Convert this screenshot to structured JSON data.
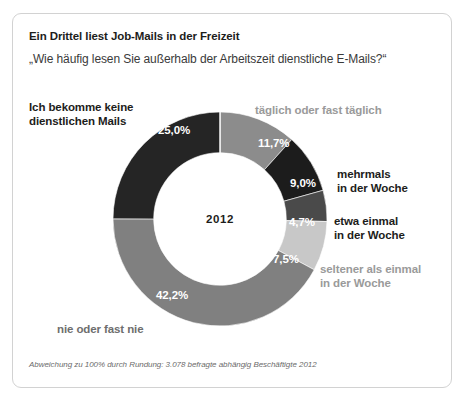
{
  "card": {
    "title": "Ein Drittel liest Job-Mails in der Freizeit",
    "subtitle": "„Wie häufig lesen Sie außerhalb der Arbeitszeit dienstliche E-Mails?“",
    "footnote": "Abweichung zu 100% durch Rundung: 3.078 befragte abhängig Beschäftigte 2012",
    "center_label": "2012"
  },
  "labels": {
    "no_mails": "Ich bekomme keine\ndienstlichen Mails",
    "daily": "täglich oder fast täglich",
    "several_week": "mehrmals\nin der Woche",
    "once_week": "etwa einmal\nin der Woche",
    "less_once_week": "seltener als einmal\nin der Woche",
    "never": "nie oder fast nie"
  },
  "values": {
    "no_mails": "25,0%",
    "daily": "11,7%",
    "several_week": "9,0%",
    "once_week": "4,7%",
    "less_once_week": "7,5%",
    "never": "42,2%"
  },
  "chart_data": {
    "type": "pie",
    "variant": "donut",
    "title": "Ein Drittel liest Job-Mails in der Freizeit",
    "subtitle": "„Wie häufig lesen Sie außerhalb der Arbeitszeit dienstliche E-Mails?“",
    "center_label": "2012",
    "unit": "percent",
    "start_angle_deg": 0,
    "direction": "clockwise",
    "inner_radius_ratio": 0.62,
    "categories": [
      "täglich oder fast täglich",
      "mehrmals in der Woche",
      "etwa einmal in der Woche",
      "seltener als einmal in der Woche",
      "nie oder fast nie",
      "Ich bekomme keine dienstlichen Mails"
    ],
    "values": [
      11.7,
      9.0,
      4.7,
      7.5,
      42.2,
      25.0
    ],
    "value_labels": [
      "11,7%",
      "9,0%",
      "4,7%",
      "7,5%",
      "42,2%",
      "25,0%"
    ],
    "colors": [
      "#8c8c8c",
      "#1c1c1c",
      "#4a4a4a",
      "#c8c8c8",
      "#808080",
      "#252525"
    ],
    "legend": "none",
    "grid": false,
    "note": "Abweichung zu 100% durch Rundung: 3.078 befragte abhängig Beschäftigte 2012",
    "sample_size": 3078,
    "year": 2012
  },
  "theme": {
    "frame_border": "#d2d2d2",
    "text_dark": "#1d1d1b",
    "text_mid": "#6e6e6e",
    "text_muted": "#9a9a9a",
    "background": "#ffffff"
  }
}
